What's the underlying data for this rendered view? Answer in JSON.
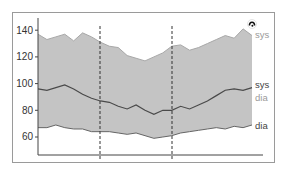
{
  "chart_data": {
    "type": "area",
    "title": "",
    "xlabel": "",
    "ylabel": "",
    "ylim": [
      40,
      150
    ],
    "yticks": [
      60,
      80,
      100,
      120,
      140
    ],
    "grid": false,
    "x_count": 25,
    "vertical_markers": [
      7,
      15
    ],
    "series": [
      {
        "name": "sys",
        "role": "band-upper",
        "color": "#999999",
        "values": [
          137,
          133,
          135,
          137,
          132,
          138,
          135,
          131,
          128,
          127,
          121,
          119,
          117,
          120,
          123,
          128,
          129,
          125,
          127,
          130,
          133,
          136,
          134,
          141,
          136
        ]
      },
      {
        "name": "sys",
        "role": "mean-line",
        "color": "#555555",
        "values": [
          96,
          95,
          97,
          99,
          96,
          92,
          89,
          87,
          86,
          83,
          81,
          84,
          80,
          77,
          80,
          80,
          83,
          81,
          84,
          87,
          91,
          95,
          96,
          95,
          97
        ]
      },
      {
        "name": "dia",
        "role": "band-lower",
        "color": "#555555",
        "values": [
          67,
          67,
          69,
          67,
          66,
          66,
          64,
          64,
          64,
          63,
          62,
          63,
          61,
          59,
          60,
          61,
          63,
          64,
          65,
          66,
          67,
          66,
          68,
          67,
          69
        ]
      }
    ],
    "legend": [
      {
        "label": "sys",
        "color": "#999999",
        "position": "upper band"
      },
      {
        "label": "sys",
        "color": "#555555",
        "position": "mean line"
      },
      {
        "label": "dia",
        "color": "#999999",
        "position": "mean line"
      },
      {
        "label": "dia",
        "color": "#555555",
        "position": "lower band"
      }
    ],
    "fill_color": "#c4c4c4"
  },
  "labels": {
    "y140": "140",
    "y120": "120",
    "y100": "100",
    "y80": "80",
    "y60": "60",
    "sys_upper": "sys",
    "sys_mid": "sys",
    "dia_mid": "dia",
    "dia_lower": "dia"
  },
  "icons": {
    "corner": "circle-logo-icon"
  }
}
